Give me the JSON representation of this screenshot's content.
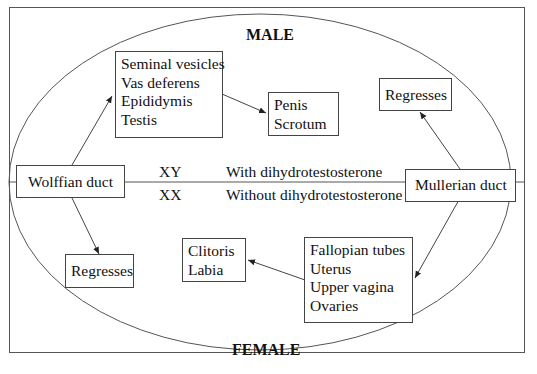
{
  "diagram": {
    "title_top": "MALE",
    "title_bottom": "FEMALE",
    "wolffian": {
      "label": "Wolffian duct"
    },
    "mullerian": {
      "label": "Mullerian duct"
    },
    "male_derivatives": [
      "Seminal vesicles",
      "Vas deferens",
      "Epididymis",
      "Testis"
    ],
    "external_male": [
      "Penis",
      "Scrotum"
    ],
    "male_regress": "Regresses",
    "female_regress": "Regresses",
    "female_derivatives": [
      "Fallopian tubes",
      "Uterus",
      "Upper vagina",
      "Ovaries"
    ],
    "external_female": [
      "Clitoris",
      "Labia"
    ],
    "karyotype_male": "XY",
    "karyotype_female": "XX",
    "condition_male": "With dihydrotestosterone",
    "condition_female": "Without dihydrotestosterone"
  },
  "colors": {
    "line": "#444444",
    "ellipse": "#555555",
    "frame": "#555555"
  }
}
